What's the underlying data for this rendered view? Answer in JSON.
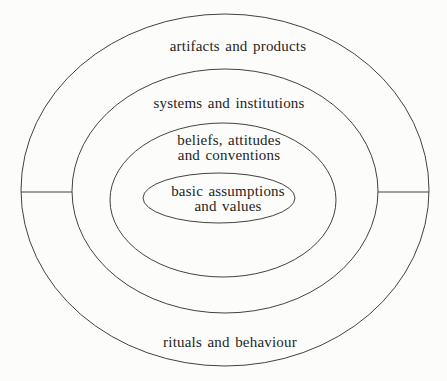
{
  "diagram": {
    "rings": [
      {
        "name": "outer",
        "top_label": "artifacts and products",
        "bottom_label": "rituals and behaviour"
      },
      {
        "name": "systems",
        "label": "systems and institutions"
      },
      {
        "name": "beliefs",
        "label_line1": "beliefs, attitudes",
        "label_line2": "and conventions"
      },
      {
        "name": "core",
        "label_line1": "basic assumptions",
        "label_line2": "and values"
      }
    ],
    "colors": {
      "line": "#424242",
      "background": "#fcfcfa",
      "text": "#1f1f1f"
    }
  }
}
